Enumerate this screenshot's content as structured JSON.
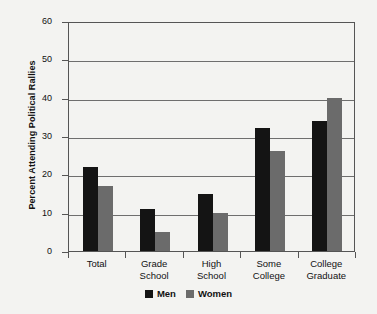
{
  "chart_data": {
    "type": "bar",
    "title": "",
    "xlabel": "",
    "ylabel": "Percent Attending Political Rallies",
    "ylim": [
      0,
      60
    ],
    "yticks": [
      0,
      10,
      20,
      30,
      40,
      50,
      60
    ],
    "ytick_labels": [
      "0",
      "10",
      "20",
      "30",
      "40",
      "50",
      "60"
    ],
    "grid": true,
    "legend_position": "bottom-center",
    "categories": [
      "Total",
      "Grade School",
      "High School",
      "Some College",
      "College Graduate"
    ],
    "category_lines": [
      {
        "line1": "Total",
        "line2": ""
      },
      {
        "line1": "Grade",
        "line2": "School"
      },
      {
        "line1": "High",
        "line2": "School"
      },
      {
        "line1": "Some",
        "line2": "College"
      },
      {
        "line1": "College",
        "line2": "Graduate"
      }
    ],
    "series": [
      {
        "name": "Men",
        "color": "#141414",
        "values": [
          22,
          11,
          15,
          32,
          34
        ]
      },
      {
        "name": "Women",
        "color": "#6b6b6b",
        "values": [
          17,
          5,
          10,
          26,
          40
        ]
      }
    ]
  },
  "legend": {
    "items": [
      {
        "label": "Men",
        "swatch": "men-swatch"
      },
      {
        "label": "Women",
        "swatch": "women-swatch"
      }
    ]
  },
  "colors": {
    "background": "#f3f3f1",
    "axis": "#555555",
    "gridline": "#6e6e6e",
    "men": "#141414",
    "women": "#6b6b6b",
    "text": "#111111"
  }
}
